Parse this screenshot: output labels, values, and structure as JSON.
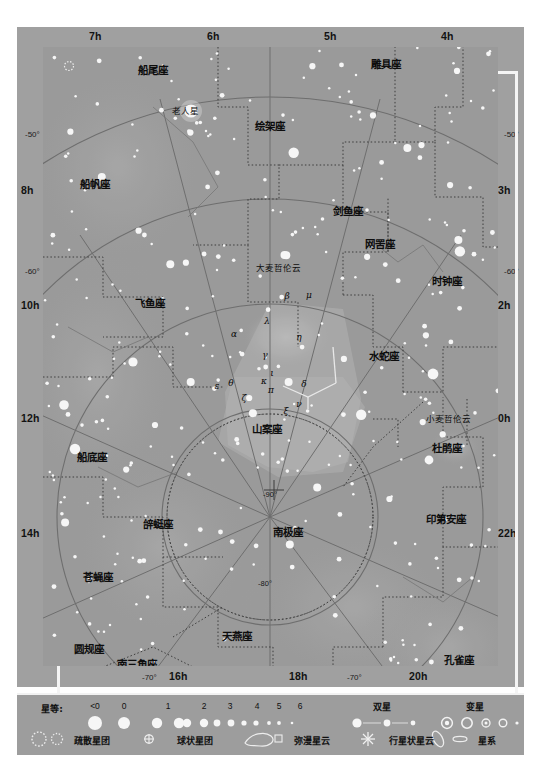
{
  "chart_data": {
    "type": "scatter",
    "projection": "south-polar",
    "center": {
      "dec": -90,
      "label": "-90°"
    },
    "axis": {
      "ra_unit": "h",
      "dec_unit": "°",
      "dec_circles": [
        "-50°",
        "-60°",
        "-70°",
        "-80°",
        "-90°"
      ],
      "grid": true,
      "legend_position": "bottom"
    },
    "ra_top": [
      "7h",
      "6h",
      "5h",
      "4h"
    ],
    "ra_left": [
      "8h",
      "10h",
      "12h",
      "14h"
    ],
    "ra_right": [
      "3h",
      "2h",
      "0h",
      "22h"
    ],
    "ra_bottom": [
      "16h",
      "18h",
      "20h"
    ],
    "dec_left": [
      "-50°",
      "-60°"
    ],
    "dec_right": [
      "-50°",
      "-60°"
    ],
    "dec_bottom": [
      "-70°",
      "-70°"
    ],
    "dec_inner": [
      "-80°",
      "-90°"
    ],
    "constellations": [
      {
        "name": "船尾座",
        "x": 153,
        "y": 69
      },
      {
        "name": "老人星",
        "x": 185,
        "y": 110,
        "kind": "star-name"
      },
      {
        "name": "绘架座",
        "x": 270,
        "y": 125
      },
      {
        "name": "雕具座",
        "x": 386,
        "y": 63
      },
      {
        "name": "船帆座",
        "x": 95,
        "y": 183
      },
      {
        "name": "剑鱼座",
        "x": 348,
        "y": 210
      },
      {
        "name": "网罟座",
        "x": 380,
        "y": 243
      },
      {
        "name": "大麦哲伦云",
        "x": 278,
        "y": 267,
        "kind": "object"
      },
      {
        "name": "时钟座",
        "x": 447,
        "y": 280
      },
      {
        "name": "飞鱼座",
        "x": 150,
        "y": 302
      },
      {
        "name": "水蛇座",
        "x": 384,
        "y": 355
      },
      {
        "name": "小麦哲伦云",
        "x": 448,
        "y": 418,
        "kind": "object"
      },
      {
        "name": "山案座",
        "x": 267,
        "y": 428
      },
      {
        "name": "杜鹃座",
        "x": 447,
        "y": 447
      },
      {
        "name": "船底座",
        "x": 92,
        "y": 456
      },
      {
        "name": "印第安座",
        "x": 446,
        "y": 518
      },
      {
        "name": "辝蜓座",
        "x": 158,
        "y": 523
      },
      {
        "name": "南极座",
        "x": 288,
        "y": 531
      },
      {
        "name": "苍蝇座",
        "x": 98,
        "y": 576
      },
      {
        "name": "天燕座",
        "x": 237,
        "y": 635
      },
      {
        "name": "孔雀座",
        "x": 459,
        "y": 659
      },
      {
        "name": "圆规座",
        "x": 89,
        "y": 648
      },
      {
        "name": "南三角座",
        "x": 137,
        "y": 663
      },
      {
        "name": "半人马座",
        "x": 54,
        "y": 673
      }
    ],
    "greek_labels": [
      {
        "g": "β",
        "x": 287,
        "y": 296
      },
      {
        "g": "μ",
        "x": 309,
        "y": 295
      },
      {
        "g": "λ",
        "x": 267,
        "y": 321
      },
      {
        "g": "η",
        "x": 299,
        "y": 337
      },
      {
        "g": "α",
        "x": 234,
        "y": 334
      },
      {
        "g": "γ",
        "x": 265,
        "y": 355
      },
      {
        "g": "ι",
        "x": 272,
        "y": 373
      },
      {
        "g": "κ",
        "x": 264,
        "y": 381
      },
      {
        "g": "ε",
        "x": 217,
        "y": 386
      },
      {
        "g": "θ",
        "x": 231,
        "y": 383
      },
      {
        "g": "π",
        "x": 271,
        "y": 390
      },
      {
        "g": "δ",
        "x": 304,
        "y": 384
      },
      {
        "g": "ζ",
        "x": 244,
        "y": 398
      },
      {
        "g": "ξ",
        "x": 286,
        "y": 411
      },
      {
        "g": "ν",
        "x": 299,
        "y": 404
      }
    ]
  },
  "legend": {
    "magnitude_label": "星等:",
    "magnitudes": [
      {
        "label": "<0",
        "r": 7.0
      },
      {
        "label": "0",
        "r": 6.0
      },
      {
        "label": "1",
        "r": 5.2
      },
      {
        "label": "2",
        "r": 4.2
      },
      {
        "label": "3",
        "r": 3.4
      },
      {
        "label": "4",
        "r": 2.6
      },
      {
        "label": "5",
        "r": 1.9
      },
      {
        "label": "6",
        "r": 1.3
      }
    ],
    "double_star": "双星",
    "variable_star": "变星",
    "open_cluster": "疏散星团",
    "globular_cluster": "球状星团",
    "diffuse_nebula": "弥漫星云",
    "planetary_nebula": "行星状星云",
    "galaxy": "星系"
  },
  "colors": {
    "plate": "#a0a0a0",
    "sky": "#9a9a9a",
    "frame": "#f4f4f4",
    "star": "#f6f6f6",
    "line": "#707070",
    "text": "#101010"
  }
}
